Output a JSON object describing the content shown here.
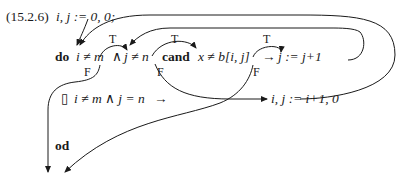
{
  "equation_number": "(15.2.6)",
  "init_statement": "i, j := 0, 0;",
  "line1": {
    "keyword_do": "do",
    "guard1": "i ≠ m",
    "and_op": "∧",
    "guard2": "j ≠ n",
    "keyword_cand": "cand",
    "guard3": "x ≠ b[i, j]",
    "arrow": "→",
    "action": "j := j+1"
  },
  "line2": {
    "box": "▯",
    "guard": "i ≠ m  ∧ j = n",
    "arrow": "→",
    "action": "i, j := i+1, 0"
  },
  "line3": {
    "keyword_od": "od"
  },
  "edge_labels": {
    "true_label": "T",
    "false_label": "F"
  },
  "colors": {
    "ink": "#1a1a1a",
    "background": "#ffffff"
  }
}
